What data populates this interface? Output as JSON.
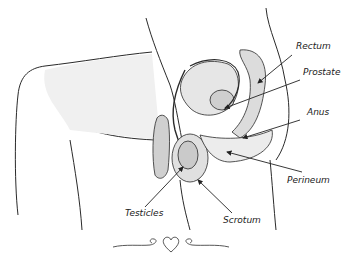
{
  "diagram": {
    "type": "anatomical-illustration",
    "labels": [
      {
        "id": "rectum",
        "text": "Rectum"
      },
      {
        "id": "prostate",
        "text": "Prostate"
      },
      {
        "id": "anus",
        "text": "Anus"
      },
      {
        "id": "perineum",
        "text": "Perineum"
      },
      {
        "id": "testicles",
        "text": "Testicles"
      },
      {
        "id": "scrotum",
        "text": "Scrotum"
      }
    ],
    "ornament": "heart-flourish",
    "colors": {
      "line": "#2a2a2a",
      "shade": "#d8d8d8",
      "background": "#ffffff"
    }
  }
}
